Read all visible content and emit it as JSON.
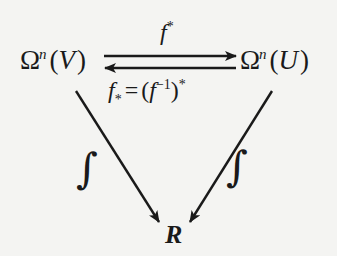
{
  "diagram": {
    "type": "commutative-diagram",
    "nodes": {
      "left": {
        "base": "Ω",
        "superscript": "n",
        "open": "(",
        "arg": "V",
        "close": ")"
      },
      "right": {
        "base": "Ω",
        "superscript": "n",
        "open": "(",
        "arg": "U",
        "close": ")"
      },
      "bottom": {
        "label": "R"
      }
    },
    "edges": {
      "top": {
        "from": "left",
        "to": "right",
        "label_base": "f",
        "label_sup": "*"
      },
      "bottom": {
        "from": "right",
        "to": "left",
        "label_base": "f",
        "label_sub": "*",
        "label_eq": "=",
        "label_rhs_open": "(",
        "label_rhs_base": "f",
        "label_rhs_sup": "−1",
        "label_rhs_close": ")",
        "label_rhs_outer_sup": "*"
      },
      "left_diagonal": {
        "from": "left",
        "to": "bottom",
        "label": "∫"
      },
      "right_diagonal": {
        "from": "right",
        "to": "bottom",
        "label": "∫"
      }
    },
    "colors": {
      "ink": "#1a1a1a",
      "paper": "#f4f4f2"
    }
  }
}
